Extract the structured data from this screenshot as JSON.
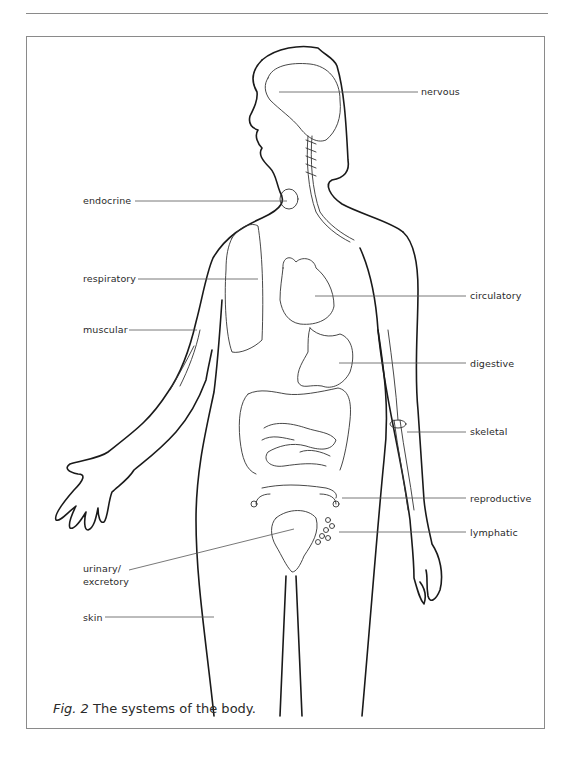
{
  "figure": {
    "caption_prefix": "Fig. 2",
    "caption_text": "The systems of the body."
  },
  "labels": [
    {
      "id": "nervous",
      "text": "nervous",
      "side": "right",
      "x": 421,
      "y": 86,
      "line": [
        279,
        92,
        418,
        92
      ]
    },
    {
      "id": "endocrine",
      "text": "endocrine",
      "side": "left",
      "x": 83,
      "y": 195,
      "line": [
        135,
        201,
        287,
        201
      ]
    },
    {
      "id": "respiratory",
      "text": "respiratory",
      "side": "left",
      "x": 83,
      "y": 273,
      "line": [
        138,
        279,
        258,
        279
      ]
    },
    {
      "id": "circulatory",
      "text": "circulatory",
      "side": "right",
      "x": 470,
      "y": 290,
      "line": [
        315,
        296,
        466,
        296
      ]
    },
    {
      "id": "muscular",
      "text": "muscular",
      "side": "left",
      "x": 83,
      "y": 324,
      "line": [
        129,
        330,
        197,
        330
      ]
    },
    {
      "id": "digestive",
      "text": "digestive",
      "side": "right",
      "x": 470,
      "y": 358,
      "line": [
        339,
        363,
        466,
        363
      ]
    },
    {
      "id": "skeletal",
      "text": "skeletal",
      "side": "right",
      "x": 470,
      "y": 426,
      "line": [
        407,
        432,
        466,
        432
      ]
    },
    {
      "id": "reproductive",
      "text": "reproductive",
      "side": "right",
      "x": 470,
      "y": 493,
      "line": [
        342,
        498,
        466,
        498
      ]
    },
    {
      "id": "lymphatic",
      "text": "lymphatic",
      "side": "right",
      "x": 470,
      "y": 527,
      "line": [
        339,
        532,
        466,
        532
      ]
    },
    {
      "id": "urinary",
      "text": "urinary/",
      "side": "left",
      "x": 83,
      "y": 563,
      "line": [
        129,
        570,
        294,
        529
      ]
    },
    {
      "id": "excretory",
      "text": "excretory",
      "side": "left",
      "x": 83,
      "y": 576,
      "line": null
    },
    {
      "id": "skin",
      "text": "skin",
      "side": "left",
      "x": 83,
      "y": 612,
      "line": [
        105,
        617,
        214,
        617
      ]
    }
  ],
  "colors": {
    "outline": "#1a1a1a",
    "organ": "#333333",
    "leader": "#555555",
    "frame": "#8a8a8a"
  }
}
